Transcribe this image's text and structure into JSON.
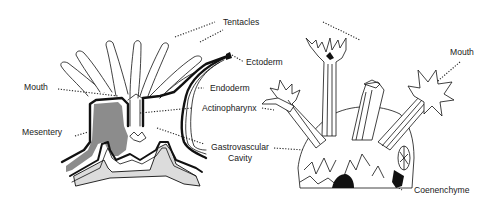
{
  "diagram": {
    "left_figure": "Cross-section of a single polyp",
    "right_figure": "Colony of polyps on coenenchyme",
    "labels": {
      "tentacles": "Tentacles",
      "ectoderm": "Ectoderm",
      "endoderm": "Endoderm",
      "mouth_left": "Mouth",
      "actinopharynx": "Actinopharynx",
      "mesentery": "Mesentery",
      "gastrovascular_1": "Gastrovascular",
      "gastrovascular_2": "Cavity",
      "mouth_right": "Mouth",
      "coenenchyme": "Coenenchyme"
    },
    "colors": {
      "line": "#111111",
      "mesentery_fill": "#8c8c8c",
      "base_fill": "#dcdcdc",
      "background": "#ffffff"
    }
  }
}
